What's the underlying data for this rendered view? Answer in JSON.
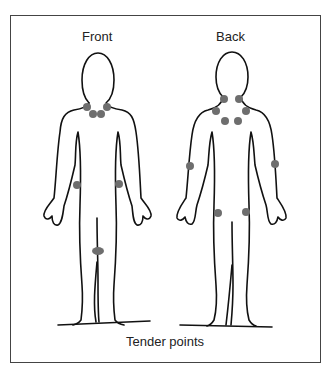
{
  "header": {
    "clipped_text": ""
  },
  "labels": {
    "front": "Front",
    "back": "Back"
  },
  "caption": "Tender points",
  "colors": {
    "outline": "#111111",
    "tender_point": "#6e6e6e",
    "frame": "#444444"
  },
  "figures": [
    {
      "name": "front",
      "tender_points": [
        {
          "x": 87,
          "y": 107,
          "region": "neck-left"
        },
        {
          "x": 107,
          "y": 107,
          "region": "neck-right"
        },
        {
          "x": 93,
          "y": 113,
          "region": "low-neck-left"
        },
        {
          "x": 101,
          "y": 113,
          "region": "low-neck-right"
        },
        {
          "x": 77,
          "y": 185,
          "region": "elbow-left"
        },
        {
          "x": 119,
          "y": 185,
          "region": "elbow-right"
        },
        {
          "x": 97,
          "y": 251,
          "region": "knee"
        }
      ]
    },
    {
      "name": "back",
      "tender_points": [
        {
          "x": 223,
          "y": 99,
          "region": "occiput-left"
        },
        {
          "x": 238,
          "y": 99,
          "region": "occiput-right"
        },
        {
          "x": 215,
          "y": 111,
          "region": "trapezius-left"
        },
        {
          "x": 245,
          "y": 111,
          "region": "trapezius-right"
        },
        {
          "x": 224,
          "y": 121,
          "region": "supraspinatus-left"
        },
        {
          "x": 237,
          "y": 121,
          "region": "supraspinatus-right"
        },
        {
          "x": 190,
          "y": 165,
          "region": "arm-left"
        },
        {
          "x": 275,
          "y": 164,
          "region": "arm-right"
        },
        {
          "x": 218,
          "y": 213,
          "region": "gluteal-left"
        },
        {
          "x": 246,
          "y": 213,
          "region": "gluteal-right"
        }
      ]
    }
  ]
}
